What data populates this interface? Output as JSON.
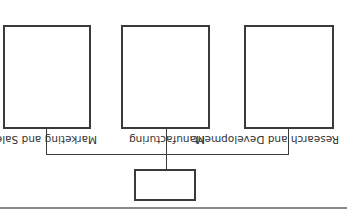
{
  "diagram": {
    "type": "org-chart",
    "orientation": "rotated-180",
    "root": {
      "label": ""
    },
    "departments": [
      {
        "label": "Research and Development"
      },
      {
        "label": "Manufacturing"
      },
      {
        "label": "Marketing and Sales"
      }
    ]
  },
  "colors": {
    "line": "#3a3a3a",
    "text": "#333333",
    "rule": "#8a8a8a",
    "background": "#ffffff"
  }
}
